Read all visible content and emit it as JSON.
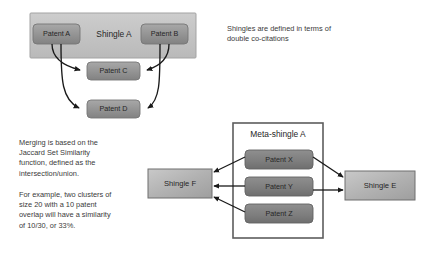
{
  "diagram": {
    "colors": {
      "patent_fill_light": "#9d9d9d",
      "patent_fill_dark": "#7f7f7f",
      "shingle_a_fill": "#bfbfbf",
      "shingle_box_fill": "#b5b5b5",
      "meta_border": "#595959",
      "arrow": "#1a1a1a",
      "text": "#3a3a3a"
    },
    "notes": [
      {
        "id": "cocitation",
        "text": "Shingles are defined in terms of\ndouble co-citations"
      },
      {
        "id": "jaccard",
        "text": "Merging is based on the\nJaccard Set Similarity\nfunction, defined as the\nintersection/union."
      },
      {
        "id": "example",
        "text": "For example, two clusters of\nsize 20 with a 10 patent\noverlap will have a similarity\nof 10/30, or 33%."
      }
    ],
    "shingle_a": {
      "label": "Shingle A",
      "patents": [
        {
          "id": "patent-a",
          "label": "Patent A"
        },
        {
          "id": "patent-b",
          "label": "Patent B"
        }
      ]
    },
    "cited_patents": [
      {
        "id": "patent-c",
        "label": "Patent C"
      },
      {
        "id": "patent-d",
        "label": "Patent D"
      }
    ],
    "meta_shingle": {
      "label": "Meta-shingle A",
      "patents": [
        {
          "id": "patent-x",
          "label": "Patent X"
        },
        {
          "id": "patent-y",
          "label": "Patent Y"
        },
        {
          "id": "patent-z",
          "label": "Patent Z"
        }
      ]
    },
    "shingle_f": {
      "label": "Shingle F"
    },
    "shingle_e": {
      "label": "Shingle E"
    }
  }
}
